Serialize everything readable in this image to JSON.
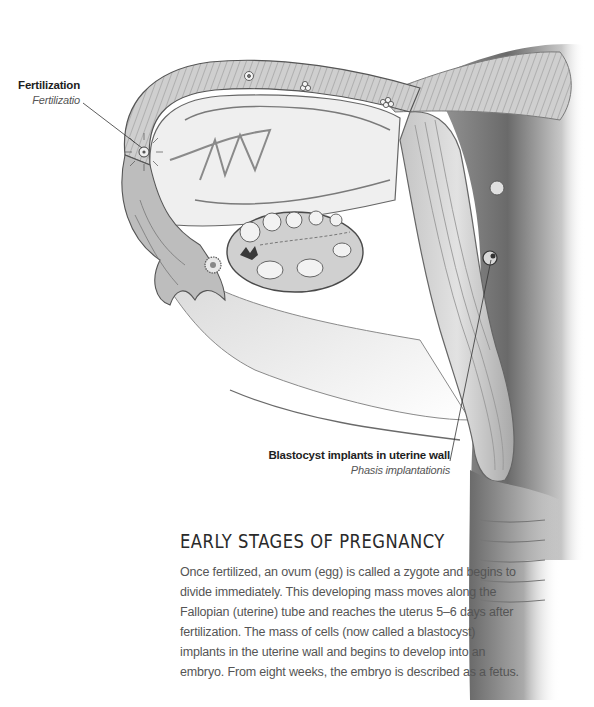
{
  "figure": {
    "palette": {
      "ink": "#2a2a2a",
      "tissue_light": "#e8e8e8",
      "tissue_mid": "#b8b8b8",
      "tissue_dark": "#6e6e6e",
      "background": "#ffffff"
    }
  },
  "labels": {
    "fertilization": {
      "main": "Fertilization",
      "latin": "Fertilizatio"
    },
    "implantation": {
      "main": "Blastocyst implants in uterine wall",
      "latin": "Phasis implantationis"
    }
  },
  "article": {
    "title": "EARLY STAGES OF PREGNANCY",
    "body": "Once fertilized, an ovum (egg) is called a zygote and begins to divide immediately. This developing mass moves along the Fallopian (uterine) tube and reaches the uterus 5–6 days after fertilization. The mass of cells (now called a blastocyst) implants in the uterine wall and begins to develop into an embryo. From eight weeks, the embryo is described as a fetus."
  }
}
